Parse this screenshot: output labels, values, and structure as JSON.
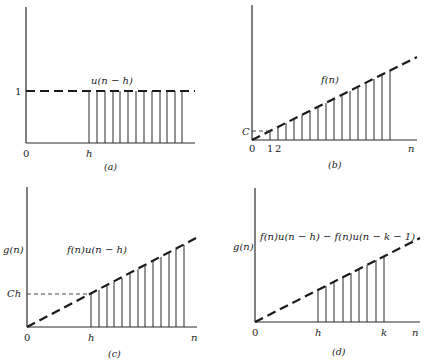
{
  "panels": {
    "a": {
      "caption": "(a)",
      "curve_label": "u(n − h)",
      "y_tick": "1",
      "origin": "0",
      "x_marks": [
        "h"
      ]
    },
    "b": {
      "caption": "(b)",
      "curve_label": "f(n)",
      "y_tick": "C",
      "origin": "0",
      "x_marks": [
        "1",
        "2"
      ],
      "x_axis_label": "n"
    },
    "c": {
      "caption": "(c)",
      "curve_label": "f(n)u(n − h)",
      "y_axis_label": "g(n)",
      "y_tick": "Ch",
      "origin": "0",
      "x_marks": [
        "h"
      ],
      "x_axis_label": "n"
    },
    "d": {
      "caption": "(d)",
      "curve_label": "f(n)u(n − h) − f(n)u(n − k − 1)",
      "y_axis_label": "g(n)",
      "origin": "0",
      "x_marks": [
        "h",
        "k"
      ],
      "x_axis_label": "n"
    }
  }
}
